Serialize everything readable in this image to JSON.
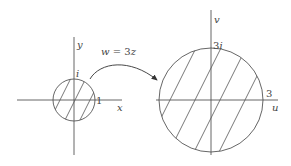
{
  "diagram": {
    "stroke_color": "#555555",
    "mapping": {
      "label": "w = 3z",
      "label_parts": {
        "w": "w",
        "eq": " = 3",
        "z": "z"
      }
    },
    "z_plane": {
      "x_axis_label": "x",
      "y_axis_label": "y",
      "real_tick_label": "1",
      "imag_tick_label": "i",
      "disk_radius": 1,
      "region": "hatched disk |z| ≤ 1"
    },
    "w_plane": {
      "u_axis_label": "u",
      "v_axis_label": "v",
      "real_tick_label": "3",
      "imag_tick_label": "3i",
      "disk_radius": 3,
      "region": "hatched disk |w| ≤ 3"
    }
  }
}
